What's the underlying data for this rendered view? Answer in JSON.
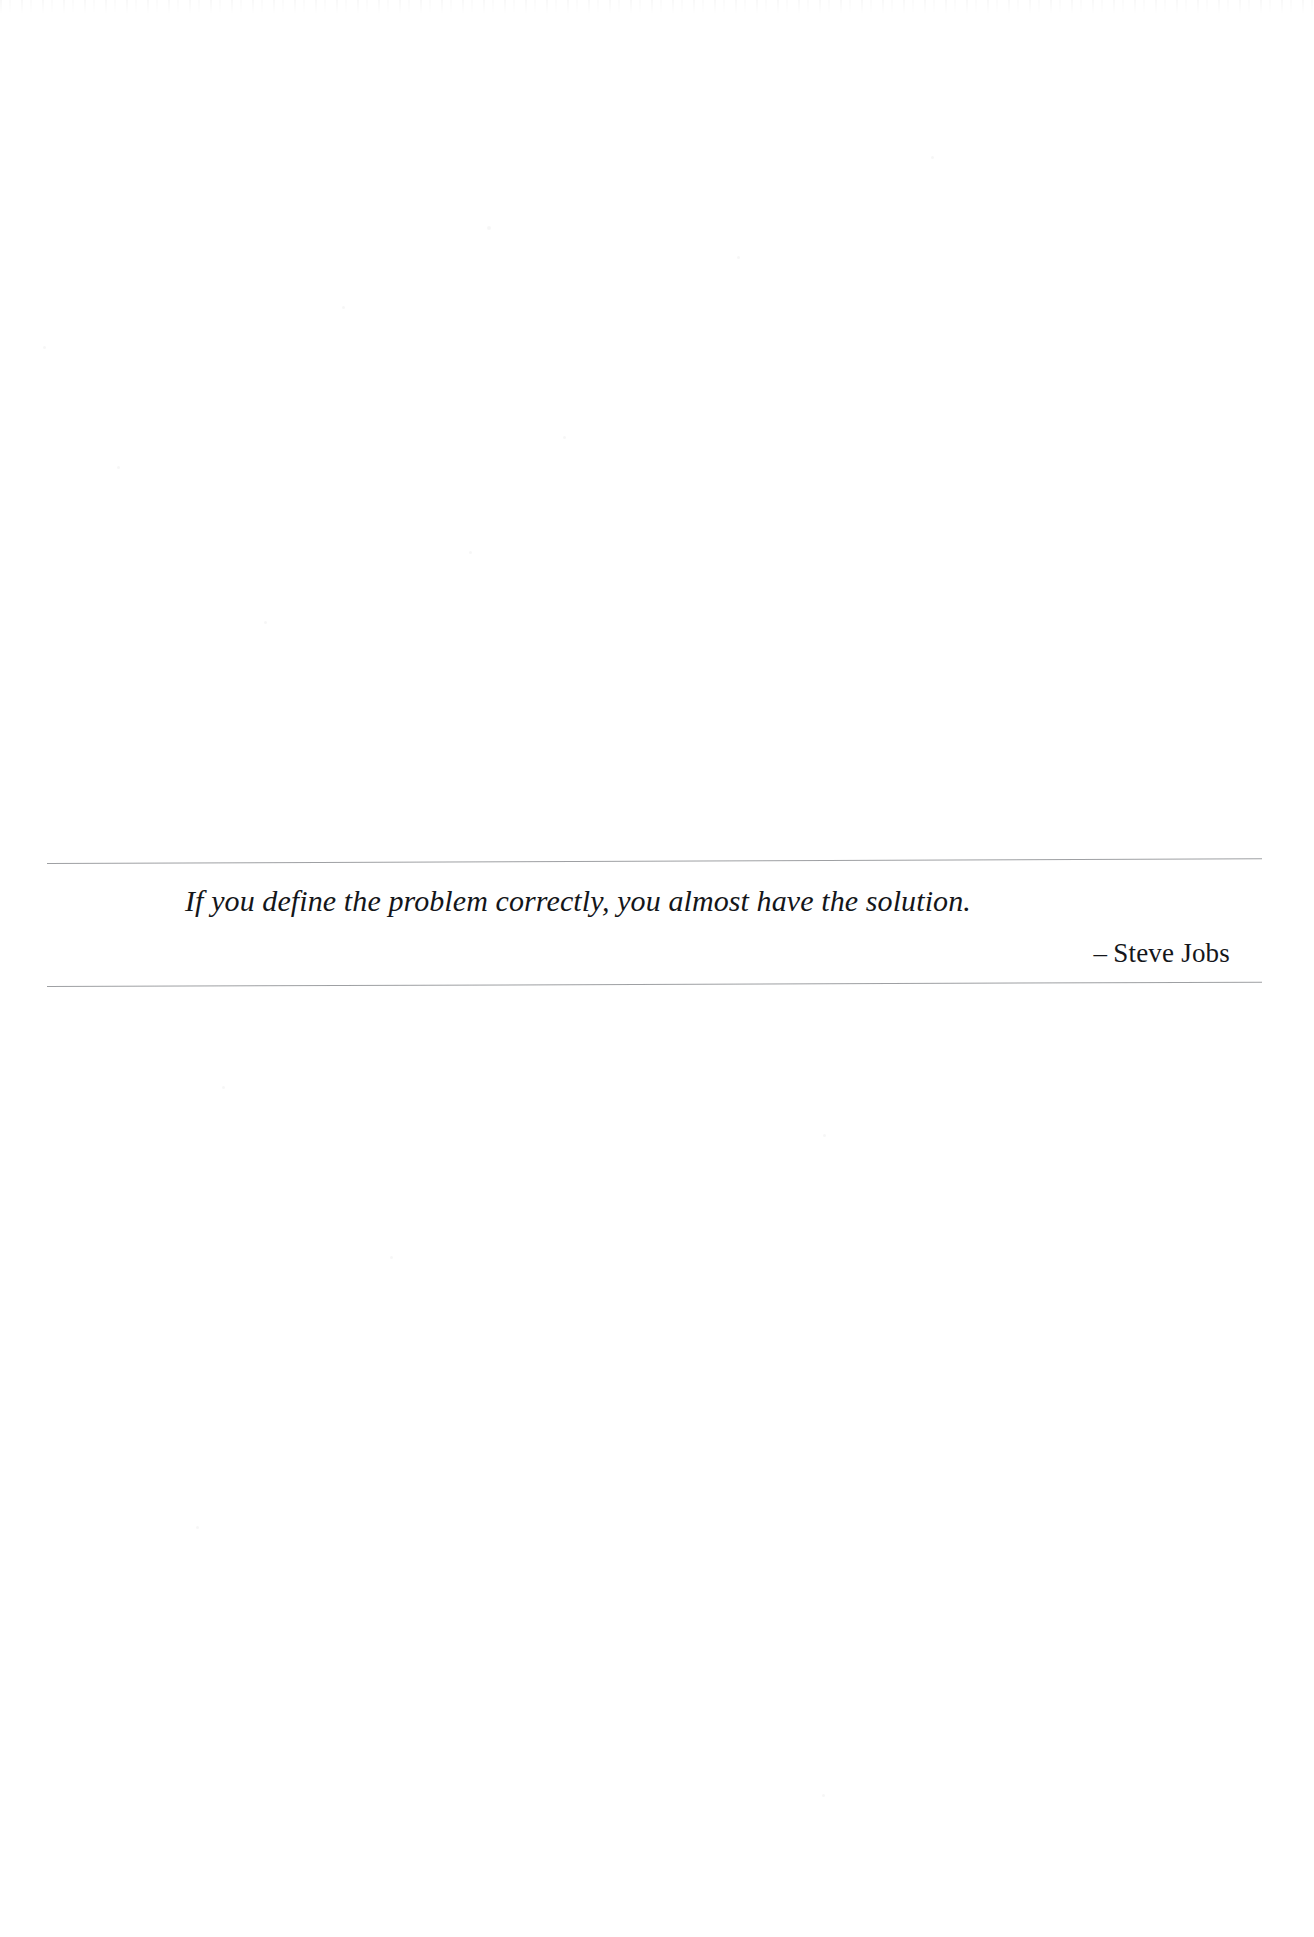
{
  "page": {
    "background_color": "#ffffff",
    "width": 1314,
    "height": 1937,
    "media": "scanned-book-page"
  },
  "pullquote": {
    "quote_text": "If you define the problem correctly, you almost have the solution.",
    "attribution_dash": "–",
    "attribution_name": "Steve Jobs",
    "attribution_full": "– Steve Jobs",
    "text_color": "#14161a",
    "rule_color": "#8d8f93",
    "rules": {
      "top_label": "top-divider",
      "bottom_label": "bottom-divider"
    }
  }
}
